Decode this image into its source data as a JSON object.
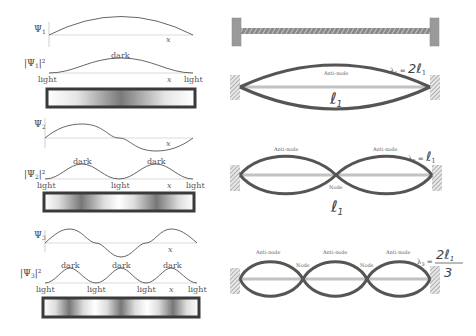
{
  "left_panel": {
    "modes": [
      {
        "psi_label": "Ψ1",
        "prob_label": "|Ψ1|²",
        "axis_label": "x",
        "peak_labels": [
          "dark"
        ],
        "node_labels": [
          "light",
          "light"
        ],
        "bar_description": "gradient dark in center"
      },
      {
        "psi_label": "Ψ2",
        "prob_label": "|Ψ2|²",
        "axis_label": "x",
        "peak_labels": [
          "dark",
          "dark"
        ],
        "node_labels": [
          "light",
          "light",
          "light"
        ],
        "bar_description": "two dark bands"
      },
      {
        "psi_label": "Ψ3",
        "prob_label": "|Ψ3|²",
        "axis_label": "x",
        "peak_labels": [
          "dark",
          "dark",
          "dark"
        ],
        "node_labels": [
          "light",
          "light",
          "light",
          "light"
        ],
        "bar_description": "three dark bands"
      }
    ]
  },
  "right_panel": {
    "string_at_rest": "taut rope between two fixed walls",
    "modes": [
      {
        "antinode_labels": [
          "Anti-node"
        ],
        "node_labels": [],
        "wavelength_label": "λ1 = 2ℓ1",
        "length_label": "ℓ1"
      },
      {
        "antinode_labels": [
          "Anti-node",
          "Anti-node"
        ],
        "node_labels": [
          "Node"
        ],
        "wavelength_label": "λ2 = ℓ1",
        "length_label": "ℓ1"
      },
      {
        "antinode_labels": [
          "Anti-node",
          "Anti-node",
          "Anti-node"
        ],
        "node_labels": [
          "Node",
          "Node"
        ],
        "wavelength_label": "λ3 = 2ℓ1/3",
        "length_label": ""
      }
    ]
  },
  "text": {
    "psi1": "Ψ",
    "sub1": "1",
    "sub2": "2",
    "sub3": "3",
    "x": "x",
    "dark": "dark",
    "light": "light",
    "antinode": "Anti-node",
    "node": "Node",
    "lambda": "λ",
    "eq": "=",
    "two_ell": "2ℓ",
    "ell": "ℓ",
    "three": "3",
    "bar_open": "|Ψ",
    "bar_close": "|²"
  },
  "colors": {
    "curve": "#555555",
    "rope": "#5a5a5a",
    "rope_rest": "#bdbdbd",
    "wall": "#9a9a9a",
    "box_border": "#3a3a3a"
  }
}
